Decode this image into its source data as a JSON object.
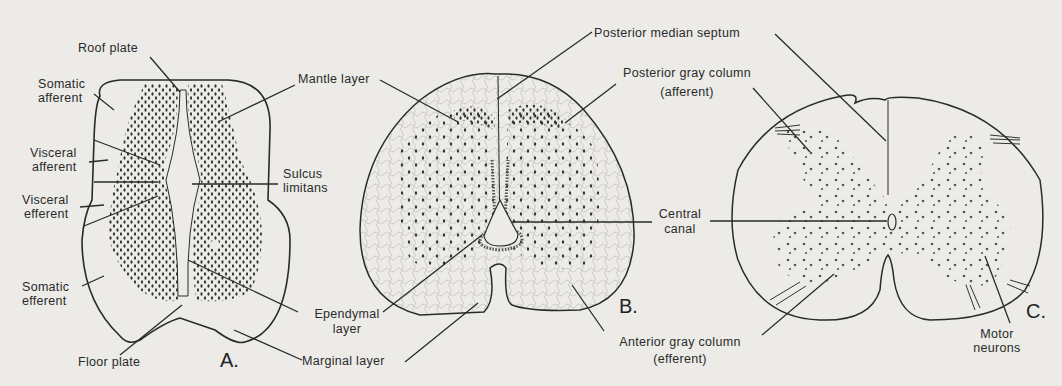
{
  "figure": {
    "background": "#ecebe8",
    "ink": "#2a2a2a",
    "panels": [
      {
        "id": "A",
        "letter": "A.",
        "labels": {
          "roof_plate": "Roof plate",
          "somatic_afferent_1": "Somatic",
          "somatic_afferent_2": "afferent",
          "mantle_layer": "Mantle layer",
          "visceral_afferent_1": "Visceral",
          "visceral_afferent_2": "afferent",
          "sulcus_limitans_1": "Sulcus",
          "sulcus_limitans_2": "limitans",
          "visceral_efferent_1": "Visceral",
          "visceral_efferent_2": "efferent",
          "somatic_efferent_1": "Somatic",
          "somatic_efferent_2": "efferent",
          "ependymal_layer_1": "Ependymal",
          "ependymal_layer_2": "layer",
          "floor_plate": "Floor plate",
          "marginal_layer": "Marginal layer"
        }
      },
      {
        "id": "B",
        "letter": "B.",
        "labels": {
          "posterior_median_septum": "Posterior median septum",
          "posterior_gray_column_1": "Posterior gray column",
          "posterior_gray_column_2": "(afferent)",
          "central_canal_1": "Central",
          "central_canal_2": "canal",
          "anterior_gray_column_1": "Anterior gray column",
          "anterior_gray_column_2": "(efferent)"
        }
      },
      {
        "id": "C",
        "letter": "C.",
        "labels": {
          "motor_neurons_1": "Motor",
          "motor_neurons_2": "neurons"
        }
      }
    ]
  }
}
